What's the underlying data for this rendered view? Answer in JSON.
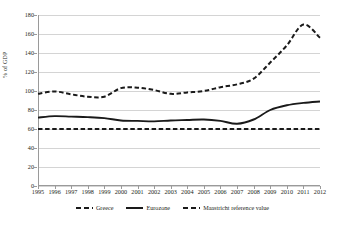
{
  "chart_data": {
    "type": "line",
    "title": "",
    "subtitle": "",
    "xlabel": "",
    "ylabel": "% of GDP",
    "ylim": [
      0,
      180
    ],
    "ytick_step": 20,
    "yticks": [
      0,
      20,
      40,
      60,
      80,
      100,
      120,
      140,
      160,
      180
    ],
    "grid": true,
    "legend_position": "bottom",
    "categories": [
      "1995",
      "1996",
      "1997",
      "1998",
      "1999",
      "2000",
      "2001",
      "2002",
      "2003",
      "2004",
      "2005",
      "2006",
      "2007",
      "2008",
      "2009",
      "2010",
      "2011",
      "2012"
    ],
    "series": [
      {
        "name": "Greece",
        "style": "dashed",
        "color": "#1a1a1a",
        "values": [
          97,
          99.5,
          96.5,
          94,
          94,
          103,
          103.5,
          101,
          97,
          98.5,
          100,
          104,
          107,
          113,
          130,
          148,
          170,
          156
        ]
      },
      {
        "name": "Eurozone",
        "style": "solid",
        "color": "#1a1a1a",
        "values": [
          72,
          73.5,
          73,
          72.5,
          71.5,
          69,
          68.5,
          68,
          69,
          69.5,
          70,
          68.5,
          65.5,
          70,
          80,
          85,
          87.5,
          89
        ]
      },
      {
        "name": "Maastricht reference value",
        "style": "dashed",
        "color": "#1a1a1a",
        "values": [
          60,
          60,
          60,
          60,
          60,
          60,
          60,
          60,
          60,
          60,
          60,
          60,
          60,
          60,
          60,
          60,
          60,
          60
        ]
      }
    ]
  },
  "legend": {
    "items": [
      {
        "label": "Greece",
        "style": "dashed"
      },
      {
        "label": "Eurozone",
        "style": "solid"
      },
      {
        "label": "Maastricht reference value",
        "style": "dashed"
      }
    ]
  }
}
